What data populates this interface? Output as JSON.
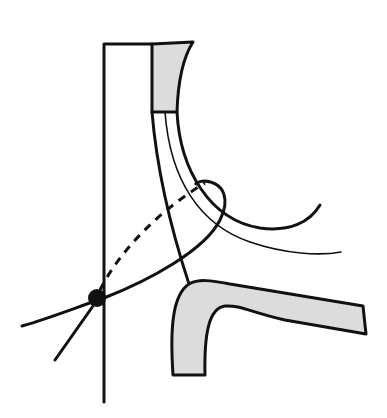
{
  "diagram": {
    "type": "line-drawing",
    "colors": {
      "line": "#111111",
      "shade": "#dcdcdc",
      "background": "#ffffff"
    },
    "elements": [
      {
        "id": "vertical-line",
        "kind": "solid-line"
      },
      {
        "id": "top-shaded-block",
        "kind": "shaded-region"
      },
      {
        "id": "thick-curve",
        "kind": "solid-curve"
      },
      {
        "id": "thin-curve",
        "kind": "thin-curve"
      },
      {
        "id": "dashed-path",
        "kind": "dashed-line"
      },
      {
        "id": "loop-curve",
        "kind": "solid-curve"
      },
      {
        "id": "bottom-shaded-bend",
        "kind": "shaded-region"
      },
      {
        "id": "marker-dot",
        "kind": "filled-circle"
      }
    ],
    "labels": []
  }
}
